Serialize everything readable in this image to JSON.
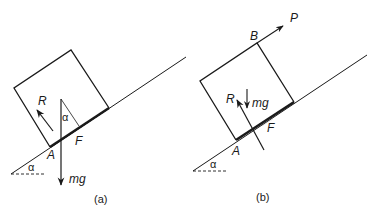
{
  "figure": {
    "panels": [
      {
        "id": "a",
        "caption": "(a)",
        "labels": {
          "reaction": "R",
          "angle_at_force": "α",
          "friction": "F",
          "contact_point": "A",
          "incline_angle": "α",
          "weight": "mg"
        }
      },
      {
        "id": "b",
        "caption": "(b)",
        "labels": {
          "applied_force": "P",
          "top_point": "B",
          "reaction": "R",
          "weight": "mg",
          "friction": "F",
          "contact_point": "A",
          "incline_angle": "α"
        }
      }
    ],
    "colors": {
      "ink": "#1a1a1a",
      "background": "#ffffff"
    }
  }
}
